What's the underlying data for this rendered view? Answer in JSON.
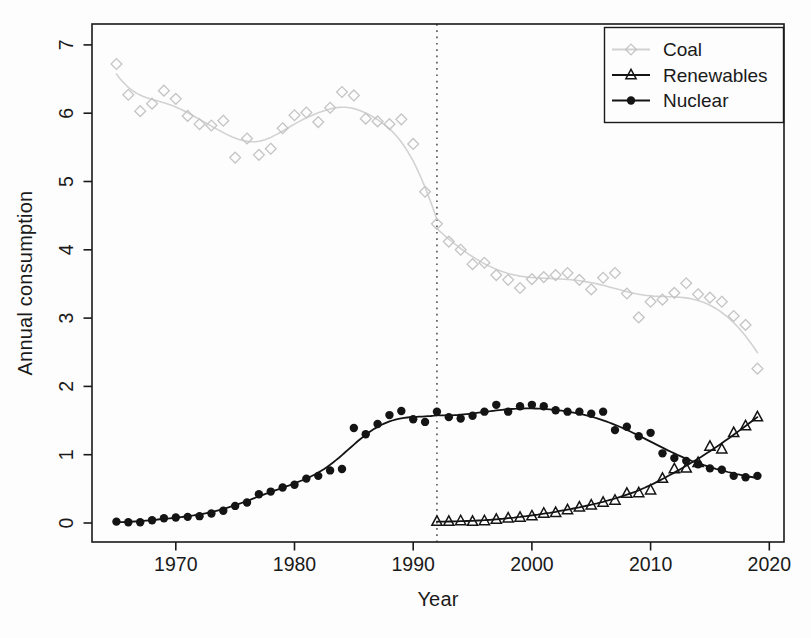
{
  "chart_data": {
    "type": "scatter",
    "title": "",
    "xlabel": "Year",
    "ylabel": "Annual consumption",
    "xlim": [
      1963,
      2021
    ],
    "ylim": [
      0,
      7
    ],
    "x_ticks": [
      1970,
      1980,
      1990,
      2000,
      2010,
      2020
    ],
    "y_ticks": [
      0,
      1,
      2,
      3,
      4,
      5,
      6,
      7
    ],
    "grid": false,
    "legend_position": "topright",
    "trend_lines": "loess-smooth, fitted separately before and after 1992",
    "vline": {
      "x": 1992,
      "style": "dotted",
      "color": "#3c3c3c"
    },
    "colors": {
      "coal": "#c4c4c4",
      "coal_line": "#d2d2d2",
      "black_series": "#141414",
      "axis": "#1a1a1a"
    },
    "series": [
      {
        "name": "Coal",
        "marker": "open-diamond",
        "color": "#c4c4c4",
        "line_color": "#d2d2d2",
        "years": [
          1965,
          1966,
          1967,
          1968,
          1969,
          1970,
          1971,
          1972,
          1973,
          1974,
          1975,
          1976,
          1977,
          1978,
          1979,
          1980,
          1981,
          1982,
          1983,
          1984,
          1985,
          1986,
          1987,
          1988,
          1989,
          1990,
          1991,
          1992,
          1993,
          1994,
          1995,
          1996,
          1997,
          1998,
          1999,
          2000,
          2001,
          2002,
          2003,
          2004,
          2005,
          2006,
          2007,
          2008,
          2009,
          2010,
          2011,
          2012,
          2013,
          2014,
          2015,
          2016,
          2017,
          2018,
          2019
        ],
        "values": [
          6.72,
          6.27,
          6.03,
          6.14,
          6.33,
          6.21,
          5.96,
          5.84,
          5.82,
          5.89,
          5.35,
          5.63,
          5.39,
          5.48,
          5.78,
          5.97,
          6.01,
          5.87,
          6.08,
          6.31,
          6.26,
          5.92,
          5.88,
          5.84,
          5.91,
          5.55,
          4.85,
          4.38,
          4.12,
          4.0,
          3.79,
          3.81,
          3.63,
          3.56,
          3.44,
          3.57,
          3.6,
          3.63,
          3.66,
          3.56,
          3.42,
          3.59,
          3.66,
          3.36,
          3.01,
          3.24,
          3.27,
          3.37,
          3.51,
          3.35,
          3.3,
          3.24,
          3.03,
          2.9,
          2.26
        ]
      },
      {
        "name": "Renewables",
        "marker": "open-triangle",
        "color": "#141414",
        "years": [
          1992,
          1993,
          1994,
          1995,
          1996,
          1997,
          1998,
          1999,
          2000,
          2001,
          2002,
          2003,
          2004,
          2005,
          2006,
          2007,
          2008,
          2009,
          2010,
          2011,
          2012,
          2013,
          2014,
          2015,
          2016,
          2017,
          2018,
          2019
        ],
        "values": [
          0.02,
          0.02,
          0.03,
          0.02,
          0.03,
          0.05,
          0.07,
          0.08,
          0.1,
          0.14,
          0.15,
          0.19,
          0.23,
          0.26,
          0.3,
          0.33,
          0.43,
          0.44,
          0.48,
          0.65,
          0.79,
          0.8,
          0.88,
          1.12,
          1.08,
          1.32,
          1.42,
          1.55
        ]
      },
      {
        "name": "Nuclear",
        "marker": "filled-circle",
        "color": "#141414",
        "years": [
          1965,
          1966,
          1967,
          1968,
          1969,
          1970,
          1971,
          1972,
          1973,
          1974,
          1975,
          1976,
          1977,
          1978,
          1979,
          1980,
          1981,
          1982,
          1983,
          1984,
          1985,
          1986,
          1987,
          1988,
          1989,
          1990,
          1991,
          1992,
          1993,
          1994,
          1995,
          1996,
          1997,
          1998,
          1999,
          2000,
          2001,
          2002,
          2003,
          2004,
          2005,
          2006,
          2007,
          2008,
          2009,
          2010,
          2011,
          2012,
          2013,
          2014,
          2015,
          2016,
          2017,
          2018,
          2019
        ],
        "values": [
          0.02,
          0.01,
          0.01,
          0.04,
          0.07,
          0.08,
          0.09,
          0.1,
          0.14,
          0.18,
          0.25,
          0.3,
          0.42,
          0.46,
          0.52,
          0.56,
          0.65,
          0.69,
          0.77,
          0.79,
          1.39,
          1.3,
          1.45,
          1.58,
          1.64,
          1.52,
          1.48,
          1.63,
          1.55,
          1.53,
          1.57,
          1.63,
          1.73,
          1.63,
          1.71,
          1.73,
          1.71,
          1.65,
          1.63,
          1.63,
          1.6,
          1.63,
          1.36,
          1.41,
          1.27,
          1.32,
          1.02,
          0.95,
          0.91,
          0.86,
          0.8,
          0.78,
          0.69,
          0.67,
          0.69
        ]
      }
    ]
  }
}
